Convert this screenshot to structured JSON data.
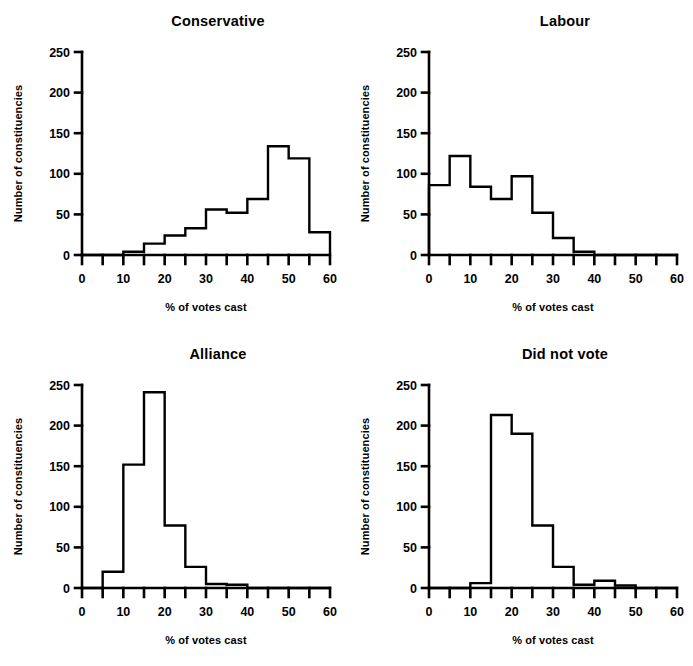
{
  "figure": {
    "width": 693,
    "height": 666,
    "background": "#ffffff",
    "ink_color": "#000000"
  },
  "common": {
    "xlabel": "% of votes cast",
    "ylabel": "Number of constituencies",
    "xlim": [
      0,
      60
    ],
    "ylim": [
      0,
      250
    ],
    "x_major_ticks": [
      0,
      10,
      20,
      30,
      40,
      50,
      60
    ],
    "x_minor_ticks": [
      5,
      15,
      25,
      35,
      45,
      55
    ],
    "y_ticks": [
      0,
      50,
      100,
      150,
      200,
      250
    ],
    "bin_width": 5,
    "grid": false,
    "legend": "none"
  },
  "panels": [
    {
      "key": "conservative",
      "title": "Conservative"
    },
    {
      "key": "labour",
      "title": "Labour"
    },
    {
      "key": "alliance",
      "title": "Alliance"
    },
    {
      "key": "did_not_vote",
      "title": "Did not vote"
    }
  ],
  "chart_data": [
    {
      "type": "bar",
      "title": "Conservative",
      "xlabel": "% of votes cast",
      "ylabel": "Number of constituencies",
      "xlim": [
        0,
        60
      ],
      "ylim": [
        0,
        250
      ],
      "grid": false,
      "legend": "none",
      "bin_width": 5,
      "bin_starts": [
        0,
        5,
        10,
        15,
        20,
        25,
        30,
        35,
        40,
        45,
        50,
        55
      ],
      "categories": [
        "0-5",
        "5-10",
        "10-15",
        "15-20",
        "20-25",
        "25-30",
        "30-35",
        "35-40",
        "40-45",
        "45-50",
        "50-55",
        "55-60"
      ],
      "values": [
        0,
        0,
        4,
        14,
        24,
        33,
        56,
        52,
        69,
        134,
        119,
        28
      ]
    },
    {
      "type": "bar",
      "title": "Labour",
      "xlabel": "% of votes cast",
      "ylabel": "Number of constituencies",
      "xlim": [
        0,
        60
      ],
      "ylim": [
        0,
        250
      ],
      "grid": false,
      "legend": "none",
      "bin_width": 5,
      "bin_starts": [
        0,
        5,
        10,
        15,
        20,
        25,
        30,
        35,
        40,
        45,
        50,
        55
      ],
      "categories": [
        "0-5",
        "5-10",
        "10-15",
        "15-20",
        "20-25",
        "25-30",
        "30-35",
        "35-40",
        "40-45",
        "45-50",
        "50-55",
        "55-60"
      ],
      "values": [
        86,
        122,
        84,
        69,
        97,
        52,
        21,
        4,
        0,
        0,
        0,
        0
      ]
    },
    {
      "type": "bar",
      "title": "Alliance",
      "xlabel": "% of votes cast",
      "ylabel": "Number of constituencies",
      "xlim": [
        0,
        60
      ],
      "ylim": [
        0,
        250
      ],
      "grid": false,
      "legend": "none",
      "bin_width": 5,
      "bin_starts": [
        0,
        5,
        10,
        15,
        20,
        25,
        30,
        35,
        40,
        45,
        50,
        55
      ],
      "categories": [
        "0-5",
        "5-10",
        "10-15",
        "15-20",
        "20-25",
        "25-30",
        "30-35",
        "35-40",
        "40-45",
        "45-50",
        "50-55",
        "55-60"
      ],
      "values": [
        0,
        20,
        152,
        241,
        77,
        26,
        5,
        4,
        0,
        0,
        0,
        0
      ]
    },
    {
      "type": "bar",
      "title": "Did not vote",
      "xlabel": "% of votes cast",
      "ylabel": "Number of constituencies",
      "xlim": [
        0,
        60
      ],
      "ylim": [
        0,
        250
      ],
      "grid": false,
      "legend": "none",
      "bin_width": 5,
      "bin_starts": [
        0,
        5,
        10,
        15,
        20,
        25,
        30,
        35,
        40,
        45,
        50,
        55
      ],
      "categories": [
        "0-5",
        "5-10",
        "10-15",
        "15-20",
        "20-25",
        "25-30",
        "30-35",
        "35-40",
        "40-45",
        "45-50",
        "50-55",
        "55-60"
      ],
      "values": [
        0,
        0,
        6,
        213,
        190,
        77,
        26,
        4,
        9,
        3,
        0,
        0
      ]
    }
  ]
}
